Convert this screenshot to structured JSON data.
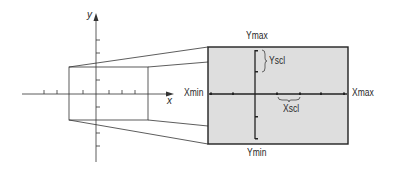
{
  "diagram": {
    "coordinate_plane": {
      "x_axis_label": "x",
      "y_axis_label": "y"
    },
    "screen": {
      "fill_color": "#dedede",
      "labels": {
        "ymax": "Ymax",
        "ymin": "Ymin",
        "xmin": "Xmin",
        "xmax": "Xmax",
        "yscl": "Yscl",
        "xscl": "Xscl"
      }
    }
  }
}
